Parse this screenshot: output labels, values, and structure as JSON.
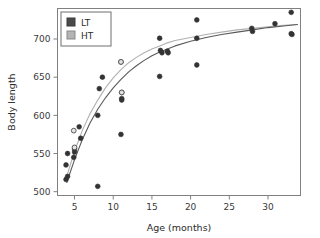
{
  "chart_data": {
    "type": "scatter",
    "title": "",
    "xlabel": "Age (months)",
    "ylabel": "Body length",
    "xlim": [
      2.8,
      34.2
    ],
    "ylim": [
      495,
      740
    ],
    "xticks": [
      5,
      10,
      15,
      20,
      25,
      30
    ],
    "yticks": [
      500,
      550,
      600,
      650,
      700
    ],
    "grid": false,
    "legend_position": "top-left",
    "legend": [
      {
        "name": "LT",
        "color": "#4a4a4a",
        "marker": "square"
      },
      {
        "name": "HT",
        "color": "#b4b4b4",
        "marker": "square"
      }
    ],
    "series": [
      {
        "name": "LT",
        "marker": "filled-circle",
        "color": "#3a3a3a",
        "points": [
          [
            3.9,
            535
          ],
          [
            3.9,
            516
          ],
          [
            4.1,
            550
          ],
          [
            4.1,
            520
          ],
          [
            4.9,
            545
          ],
          [
            5.0,
            556
          ],
          [
            5.0,
            552
          ],
          [
            5.6,
            585
          ],
          [
            5.8,
            570
          ],
          [
            8.0,
            600
          ],
          [
            8.0,
            507
          ],
          [
            8.6,
            650
          ],
          [
            8.2,
            635
          ],
          [
            11.0,
            575
          ],
          [
            11.0,
            670
          ],
          [
            11.1,
            630
          ],
          [
            11.1,
            622
          ],
          [
            11.1,
            620
          ],
          [
            16.0,
            701
          ],
          [
            16.0,
            651
          ],
          [
            16.1,
            685
          ],
          [
            16.3,
            682
          ],
          [
            17.0,
            684
          ],
          [
            17.1,
            682
          ],
          [
            20.8,
            725
          ],
          [
            20.8,
            701
          ],
          [
            20.8,
            666
          ],
          [
            27.9,
            714
          ],
          [
            28.0,
            710
          ],
          [
            30.9,
            720
          ],
          [
            33.0,
            735
          ],
          [
            33.0,
            707
          ],
          [
            33.1,
            706
          ]
        ]
      },
      {
        "name": "HT",
        "marker": "open-circle",
        "color": "#6a6a6a",
        "points": [
          [
            4.9,
            580
          ],
          [
            5.0,
            558
          ],
          [
            11.0,
            670
          ],
          [
            11.1,
            630
          ]
        ]
      }
    ],
    "curves": [
      {
        "name": "HT",
        "color": "#b0b0b0",
        "description": "Upper fitted growth curve (HT)",
        "points": [
          [
            4.0,
            520
          ],
          [
            5.0,
            553
          ],
          [
            6.0,
            580
          ],
          [
            7.0,
            602
          ],
          [
            8.0,
            620
          ],
          [
            9.0,
            636
          ],
          [
            10.0,
            649
          ],
          [
            11.0,
            660
          ],
          [
            12.0,
            669
          ],
          [
            13.0,
            676
          ],
          [
            14.0,
            682
          ],
          [
            15.0,
            687
          ],
          [
            16.0,
            691
          ],
          [
            17.0,
            695
          ],
          [
            18.0,
            698
          ],
          [
            20.0,
            702
          ],
          [
            22.0,
            706
          ],
          [
            24.0,
            709
          ],
          [
            26.0,
            712
          ],
          [
            28.0,
            714
          ],
          [
            30.0,
            716
          ],
          [
            32.0,
            718
          ],
          [
            33.8,
            719
          ]
        ]
      },
      {
        "name": "LT",
        "color": "#5a5a5a",
        "description": "Lower fitted growth curve (LT)",
        "points": [
          [
            4.0,
            512
          ],
          [
            5.0,
            542
          ],
          [
            6.0,
            568
          ],
          [
            7.0,
            590
          ],
          [
            8.0,
            608
          ],
          [
            9.0,
            623
          ],
          [
            10.0,
            636
          ],
          [
            11.0,
            647
          ],
          [
            12.0,
            657
          ],
          [
            13.0,
            665
          ],
          [
            14.0,
            672
          ],
          [
            15.0,
            678
          ],
          [
            16.0,
            683
          ],
          [
            17.0,
            687
          ],
          [
            18.0,
            691
          ],
          [
            20.0,
            697
          ],
          [
            22.0,
            702
          ],
          [
            24.0,
            706
          ],
          [
            26.0,
            709
          ],
          [
            28.0,
            712
          ],
          [
            30.0,
            715
          ],
          [
            32.0,
            717
          ],
          [
            33.8,
            719
          ]
        ]
      }
    ]
  },
  "axis": {
    "x_title": "Age (months)",
    "y_title": "Body length",
    "x_tick_labels": [
      "5",
      "10",
      "15",
      "20",
      "25",
      "30"
    ],
    "y_tick_labels": [
      "500",
      "550",
      "600",
      "650",
      "700"
    ]
  },
  "legend": {
    "lt_label": "LT",
    "ht_label": "HT"
  },
  "colors": {
    "lt_swatch": "#4a4a4a",
    "ht_swatch": "#b4b4b4",
    "frame": "#808080",
    "marker": "#333333"
  }
}
